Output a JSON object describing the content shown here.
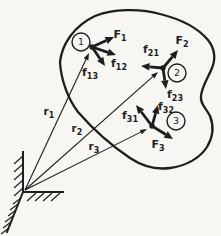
{
  "figure": {
    "width": 221,
    "height": 236,
    "background_color": "#f7f6f3",
    "ink_color": "#1e1e1e"
  },
  "body_outline": {
    "path": "M 60 62 C 62 44 74 26 95 16 C 112 9 140 8 160 14 C 180 19 198 28 208 40 C 215 49 216 58 212 68 C 208 78 202 86 201 96 C 200 104 206 108 210 116 C 214 126 213 137 207 147 C 200 158 186 166 170 168 C 155 170 142 166 130 158 C 112 146 92 128 78 112 C 68 99 61 80 60 62 Z",
    "stroke_width": 2.3
  },
  "particles": [
    {
      "id": "1",
      "label": "1",
      "circle": {
        "cx": 81,
        "cy": 42,
        "r": 9
      },
      "dot": {
        "cx": 92,
        "cy": 47,
        "r": 2.7
      }
    },
    {
      "id": "2",
      "label": "2",
      "circle": {
        "cx": 177,
        "cy": 73,
        "r": 9
      },
      "dot": {
        "cx": 163,
        "cy": 68,
        "r": 2.7
      }
    },
    {
      "id": "3",
      "label": "3",
      "circle": {
        "cx": 176,
        "cy": 121,
        "r": 9
      },
      "dot": {
        "cx": 152,
        "cy": 126,
        "r": 2.7
      }
    }
  ],
  "forces": [
    {
      "id": "F1",
      "base": "F",
      "sub": "1",
      "kind": "external",
      "from": [
        92,
        47
      ],
      "to": [
        114,
        37
      ],
      "label": [
        120,
        35
      ]
    },
    {
      "id": "f12",
      "base": "f",
      "sub": "12",
      "kind": "internal",
      "from": [
        92,
        47
      ],
      "to": [
        116,
        55
      ],
      "label": [
        119,
        64
      ]
    },
    {
      "id": "f13",
      "base": "f",
      "sub": "13",
      "kind": "internal",
      "from": [
        92,
        47
      ],
      "to": [
        105,
        66
      ],
      "label": [
        90,
        73
      ]
    },
    {
      "id": "F2",
      "base": "F",
      "sub": "2",
      "kind": "external",
      "from": [
        163,
        68
      ],
      "to": [
        178,
        50
      ],
      "label": [
        182,
        41
      ]
    },
    {
      "id": "f21",
      "base": "f",
      "sub": "21",
      "kind": "internal",
      "from": [
        163,
        68
      ],
      "to": [
        141,
        66
      ],
      "label": [
        151,
        50
      ]
    },
    {
      "id": "f23",
      "base": "f",
      "sub": "23",
      "kind": "internal",
      "from": [
        163,
        68
      ],
      "to": [
        166,
        89
      ],
      "label": [
        175,
        95
      ]
    },
    {
      "id": "f31",
      "base": "f",
      "sub": "31",
      "kind": "internal",
      "from": [
        152,
        126
      ],
      "to": [
        136,
        105
      ],
      "label": [
        130,
        116
      ]
    },
    {
      "id": "f32",
      "base": "f",
      "sub": "32",
      "kind": "internal",
      "from": [
        152,
        126
      ],
      "to": [
        158,
        105
      ],
      "label": [
        166,
        107
      ]
    },
    {
      "id": "F3",
      "base": "F",
      "sub": "3",
      "kind": "external",
      "from": [
        152,
        126
      ],
      "to": [
        173,
        139
      ],
      "label": [
        158,
        145
      ]
    }
  ],
  "position_vectors": [
    {
      "id": "r1",
      "base": "r",
      "sub": "1",
      "from": [
        25,
        190
      ],
      "to": [
        89,
        53
      ],
      "label": [
        49,
        112
      ]
    },
    {
      "id": "r2",
      "base": "r",
      "sub": "2",
      "from": [
        25,
        190
      ],
      "to": [
        158,
        72
      ],
      "label": [
        77,
        129
      ]
    },
    {
      "id": "r3",
      "base": "r",
      "sub": "3",
      "from": [
        25,
        190
      ],
      "to": [
        147,
        129
      ],
      "label": [
        94,
        147
      ]
    }
  ],
  "support": {
    "wall_line": [
      23,
      152,
      23,
      192
    ],
    "ground_line": [
      23,
      192,
      63,
      192
    ],
    "slope_line": [
      23,
      192,
      7,
      232
    ],
    "stroke_width": 2,
    "hatch_stroke_width": 1.2,
    "wall_hatches": [
      [
        23,
        156,
        14,
        164
      ],
      [
        23,
        164,
        14,
        172
      ],
      [
        23,
        172,
        14,
        180
      ],
      [
        23,
        180,
        14,
        188
      ],
      [
        23,
        188,
        14,
        196
      ]
    ],
    "ground_hatches": [
      [
        36,
        193,
        27,
        201
      ],
      [
        44,
        193,
        35,
        201
      ],
      [
        52,
        193,
        43,
        201
      ],
      [
        60,
        193,
        51,
        201
      ]
    ],
    "slope_hatches": [
      [
        21,
        198,
        13,
        204
      ],
      [
        18,
        204,
        10,
        210
      ],
      [
        16,
        210,
        8,
        216
      ],
      [
        13,
        216,
        5,
        222
      ],
      [
        11,
        222,
        3,
        228
      ],
      [
        9,
        228,
        1,
        234
      ]
    ]
  },
  "style": {
    "force_arrow": {
      "shaft_width": 2.8,
      "head_length": 8.5,
      "head_width": 7.5
    },
    "vector_arrow": {
      "shaft_width": 1.1,
      "head_length": 7,
      "head_width": 5
    },
    "force_label_size": 11,
    "force_sub_size": 8,
    "vector_label_size": 10.5,
    "vector_sub_size": 8,
    "particle_number_size": 9.5,
    "circle_stroke_width": 1.4
  }
}
